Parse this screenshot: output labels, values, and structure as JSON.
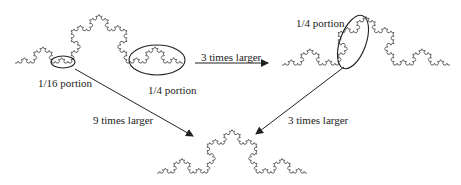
{
  "labels": {
    "portion_16": "1/16 portion",
    "portion_4_left": "1/4 portion",
    "portion_4_right": "1/4 portion",
    "arrow_3x_top": "3 times larger",
    "arrow_9x": "9 times larger",
    "arrow_3x_bottom": "3 times larger"
  },
  "colors": {
    "curve": "#555555",
    "ellipse": "#222222",
    "arrow": "#222222",
    "text": "#222222"
  },
  "curves": [
    {
      "name": "koch-curve-top-left",
      "start": [
        15,
        63
      ],
      "end": [
        183,
        63
      ],
      "depth": 4
    },
    {
      "name": "koch-curve-top-right",
      "start": [
        282,
        65
      ],
      "end": [
        450,
        65
      ],
      "depth": 4
    },
    {
      "name": "koch-curve-bottom",
      "start": [
        157,
        173
      ],
      "end": [
        307,
        173
      ],
      "depth": 4
    }
  ]
}
